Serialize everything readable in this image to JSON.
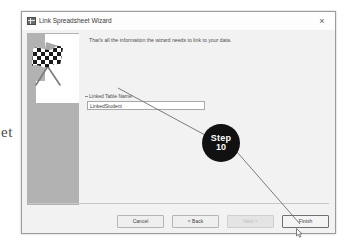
{
  "window": {
    "title": "Link Spreadsheet Wizard",
    "icon": "spreadsheet-wizard-icon",
    "close_label": "×"
  },
  "content": {
    "intro_text": "That's all the information the wizard needs to link to your data.",
    "field": {
      "label": "Linked Table Name:",
      "value": "LinkedStudent",
      "placeholder": "Linked Table Name"
    }
  },
  "sidebar": {
    "image": "checkered-racing-flags-illustration"
  },
  "buttons": [
    {
      "name": "cancel-button",
      "label": "Cancel",
      "state": "enabled"
    },
    {
      "name": "back-button",
      "label": "< Back",
      "state": "enabled"
    },
    {
      "name": "next-button",
      "label": "Next >",
      "state": "disabled"
    },
    {
      "name": "finish-button",
      "label": "Finish",
      "state": "default"
    }
  ],
  "annotation": {
    "step_word": "Step",
    "step_number": "10",
    "callout_color": "#111111",
    "leader_color": "#6e6e6e"
  },
  "margin": {
    "stray_text": "et"
  },
  "colors": {
    "dialog_bg": "#f2f2f2",
    "titlebar_bg": "#fdfdfd",
    "sidebar_bg": "#b2b2b2",
    "input_bg": "#ffffff",
    "border": "#9b9b9b"
  }
}
